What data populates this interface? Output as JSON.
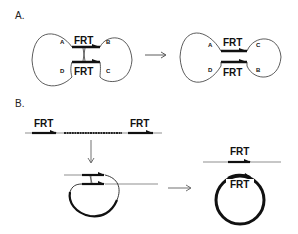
{
  "panels": {
    "a": {
      "label": "A.",
      "before": {
        "site_label_top": "FRT",
        "site_label_bottom": "FRT",
        "segments": [
          "A",
          "B",
          "D",
          "C"
        ]
      },
      "after": {
        "site_label_top": "FRT",
        "site_label_bottom": "FRT",
        "segments": [
          "A",
          "C",
          "D",
          "B"
        ]
      }
    },
    "b": {
      "label": "B.",
      "linear": {
        "site_label_left": "FRT",
        "site_label_right": "FRT"
      },
      "products": {
        "linear_site_label": "FRT",
        "circle_site_label": "FRT"
      }
    }
  },
  "colors": {
    "line": "#111111",
    "thin_line": "#444444",
    "background": "#ffffff"
  }
}
